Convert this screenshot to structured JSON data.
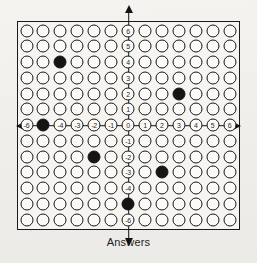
{
  "sheet": {
    "caption": "Answers",
    "border_color": "#1a1a1a",
    "background_color": "#f6f5f2",
    "bubble_fill_color": "#151515",
    "bubble_outline_color": "#171717",
    "axis_color": "#141414"
  },
  "chart_data": {
    "type": "scatter",
    "title": "Answers",
    "xlabel": "",
    "ylabel": "",
    "xlim": [
      -6,
      6
    ],
    "ylim": [
      -6,
      6
    ],
    "grid": true,
    "legend": null,
    "columns": 13,
    "rows": 13,
    "x_tick_labels": [
      "-6",
      "-5",
      "-4",
      "-3",
      "-2",
      "-1",
      "0",
      "1",
      "2",
      "3",
      "4",
      "5",
      "6"
    ],
    "y_tick_labels": [
      "6",
      "5",
      "4",
      "3",
      "2",
      "1",
      "0",
      "-1",
      "-2",
      "-3",
      "-4",
      "-5",
      "-6"
    ],
    "x_axis_arrows": [
      "left",
      "right"
    ],
    "y_axis_arrows": [
      "up",
      "down"
    ],
    "points": [
      {
        "x": -4,
        "y": 4,
        "state": "filled"
      },
      {
        "x": 3,
        "y": 2,
        "state": "filled"
      },
      {
        "x": -5,
        "y": 0,
        "state": "filled"
      },
      {
        "x": -2,
        "y": -2,
        "state": "filled"
      },
      {
        "x": 2,
        "y": -3,
        "state": "filled"
      },
      {
        "x": 0,
        "y": -5,
        "state": "filled"
      }
    ],
    "filled_count": 6
  }
}
